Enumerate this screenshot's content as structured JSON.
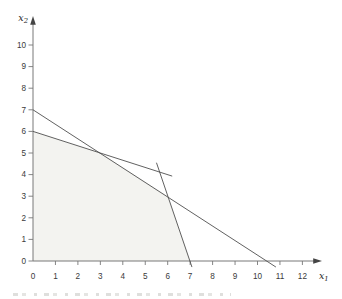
{
  "figure": {
    "xlabel_var": "x",
    "xlabel_sub": "1",
    "ylabel_var": "x",
    "ylabel_sub": "2",
    "colors": {
      "background": "#ffffff",
      "axis": "#787878",
      "constraint_line": "#4f4f4f",
      "region_fill": "#f3f3f0",
      "tick_label": "#3a3a3a",
      "axis_label": "#262626"
    }
  },
  "chart_data": {
    "type": "line",
    "title": "",
    "xlabel": "x₁",
    "ylabel": "x₂",
    "xlim": [
      0,
      12.9
    ],
    "ylim": [
      0,
      11.3
    ],
    "grid": false,
    "legend": "none",
    "x_ticks": [
      0,
      1,
      2,
      3,
      4,
      5,
      6,
      7,
      8,
      9,
      10,
      11,
      12
    ],
    "y_ticks": [
      0,
      1,
      2,
      3,
      4,
      5,
      6,
      7,
      8,
      9,
      10
    ],
    "series": [
      {
        "name": "constraint-line-1",
        "equation": "2x1 + 3x2 = 21",
        "points": [
          [
            0,
            7
          ],
          [
            10.82,
            -0.28
          ]
        ],
        "intercepts": {
          "x2_axis": 7,
          "x1_axis": 10.5
        }
      },
      {
        "name": "constraint-line-2",
        "equation": "x1 + 3x2 = 18",
        "points": [
          [
            0,
            6
          ],
          [
            6.2,
            3.93
          ]
        ],
        "intercepts": {
          "x2_axis": 6
        }
      },
      {
        "name": "constraint-line-3",
        "equation": "3x1 + x2 = 21",
        "points": [
          [
            5.5,
            4.55
          ],
          [
            7.08,
            -0.28
          ]
        ],
        "intercepts": {
          "x1_axis": 7
        }
      }
    ],
    "line_intersections": [
      [
        3,
        5
      ],
      [
        6,
        3
      ],
      [
        5.625,
        4.125
      ]
    ],
    "feasible_region_vertices": [
      [
        0,
        0
      ],
      [
        0,
        6
      ],
      [
        3,
        5
      ],
      [
        6,
        3
      ],
      [
        7,
        0
      ]
    ]
  }
}
